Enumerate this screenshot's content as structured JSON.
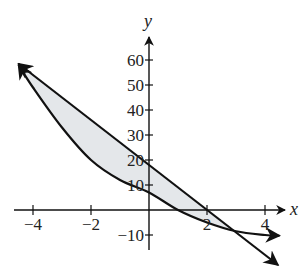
{
  "chart_data": {
    "type": "line",
    "title": "",
    "xlabel": "x",
    "ylabel": "y",
    "xlim": [
      -4.5,
      4.8
    ],
    "ylim": [
      -15,
      65
    ],
    "grid": false,
    "legend": null,
    "x_ticks": [
      -4,
      -2,
      2,
      4
    ],
    "x_tick_labels": [
      "−4",
      "−2",
      "2",
      "4"
    ],
    "y_ticks": [
      -10,
      10,
      20,
      30,
      40,
      50,
      60
    ],
    "y_tick_labels": [
      "−10",
      "10",
      "20",
      "30",
      "40",
      "50",
      "60"
    ],
    "series": [
      {
        "name": "line",
        "kind": "straight line",
        "x": [
          -4.5,
          -4,
          -2,
          0,
          2,
          3,
          4,
          4.45
        ],
        "y": [
          58.5,
          54,
          36,
          18,
          0,
          -9,
          -18,
          -22
        ]
      },
      {
        "name": "curve",
        "kind": "decreasing curve",
        "x": [
          -4.5,
          -4,
          -3,
          -2,
          -1,
          0,
          1,
          2,
          3,
          4,
          4.5
        ],
        "y": [
          58,
          49,
          33,
          20,
          12,
          7,
          0,
          -5,
          -8.5,
          -10,
          -10.3
        ]
      }
    ],
    "shaded_region": {
      "description": "region bounded between the line and the curve",
      "x_range": [
        -4.5,
        3
      ],
      "fill": "#e4e7ea"
    },
    "intersections": [
      {
        "x": -4.5,
        "y": 58
      },
      {
        "x": 3,
        "y": -9
      }
    ]
  },
  "colors": {
    "stroke": "#111111",
    "fill": "#e4e7ea"
  }
}
